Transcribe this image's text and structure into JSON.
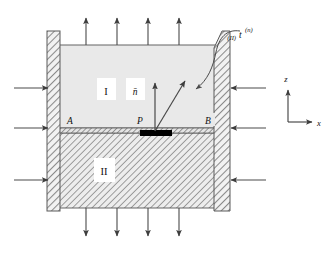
{
  "figure": {
    "type": "mechanics-free-body-diagram",
    "background_color": "#ffffff",
    "line_color": "#3a3a3a",
    "arrow_color": "#4a4a4a",
    "hatch_color": "#8c8c8c",
    "region_one_fill": "#e8e8e8",
    "region_two_fill": "#dcdcdc",
    "block_color": "#000000"
  },
  "regions": [
    {
      "id": "region-one",
      "label": "I",
      "label_x": 106,
      "label_y": 92,
      "description": "upper material region"
    },
    {
      "id": "region-two",
      "label": "II",
      "label_x": 104,
      "label_y": 172,
      "description": "lower hatched material region"
    }
  ],
  "points": [
    {
      "id": "point-a",
      "label": "A",
      "label_x": 70,
      "label_y": 122
    },
    {
      "id": "point-p",
      "label": "P",
      "label_x": 140,
      "label_y": 122
    },
    {
      "id": "point-b",
      "label": "B",
      "label_x": 208,
      "label_y": 122
    }
  ],
  "vectors": {
    "normal": {
      "id": "normal-vector",
      "label": "n̄",
      "label_x": 134,
      "label_y": 94,
      "description": "unit outward normal at point P, pointing up"
    },
    "traction": {
      "id": "traction-vector",
      "label_main": "t",
      "label_superscript": "(n)",
      "label_prefix": "(II)",
      "label_x": 241,
      "label_y": 36,
      "description": "traction vector exerted by region II on region I at P"
    }
  },
  "axes": {
    "x": {
      "label": "x",
      "label_x": 317,
      "label_y": 127
    },
    "z": {
      "label": "z",
      "label_x": 286,
      "label_y": 80
    },
    "origin_x": 288,
    "origin_y": 122
  },
  "loads": {
    "top_arrows_count": 4,
    "bottom_arrows_count": 4,
    "left_arrows_count": 3,
    "right_arrows_count": 3,
    "top_direction": "up",
    "bottom_direction": "down",
    "left_direction": "right",
    "right_direction": "left"
  },
  "walls": {
    "left_wall_label": "left-rigid-wall",
    "right_wall_label": "right-rigid-wall"
  },
  "interface": {
    "label": "interface-AB",
    "y": 128
  }
}
